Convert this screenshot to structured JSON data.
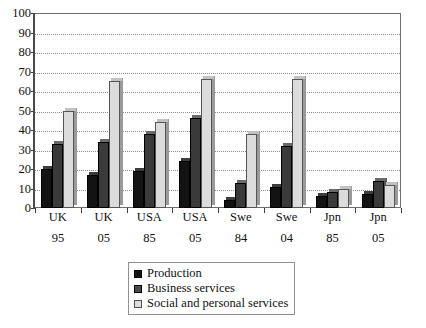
{
  "chart_data": {
    "type": "bar",
    "title": "",
    "xlabel": "",
    "ylabel": "",
    "ylim": [
      0,
      100
    ],
    "y_ticks": [
      0,
      10,
      20,
      30,
      40,
      50,
      60,
      70,
      80,
      90,
      100
    ],
    "grid": true,
    "legend_position": "bottom-center",
    "categories": [
      "UK 95",
      "UK 05",
      "USA 85",
      "USA 05",
      "Swe 84",
      "Swe 04",
      "Jpn 85",
      "Jpn 05"
    ],
    "category_lines": [
      {
        "line1": "UK",
        "line2": "95"
      },
      {
        "line1": "UK",
        "line2": "05"
      },
      {
        "line1": "USA",
        "line2": "85"
      },
      {
        "line1": "USA",
        "line2": "05"
      },
      {
        "line1": "Swe",
        "line2": "84"
      },
      {
        "line1": "Swe",
        "line2": "04"
      },
      {
        "line1": "Jpn",
        "line2": "85"
      },
      {
        "line1": "Jpn",
        "line2": "05"
      }
    ],
    "series": [
      {
        "name": "Production",
        "color": "#131313",
        "values": [
          20,
          17,
          19,
          24,
          4,
          11,
          6,
          7
        ]
      },
      {
        "name": "Business services",
        "color": "#3a3a3a",
        "values": [
          33,
          34,
          38,
          46,
          13,
          32,
          8,
          14
        ]
      },
      {
        "name": "Social and personal services",
        "color": "#dcdcdc",
        "values": [
          50,
          65,
          44,
          66,
          38,
          66,
          10,
          12
        ]
      }
    ]
  },
  "legend": {
    "items": [
      {
        "label": "Production"
      },
      {
        "label": "Business services"
      },
      {
        "label": "Social and personal services"
      }
    ]
  },
  "axis": {
    "y_tick_labels": [
      "100",
      "90",
      "80",
      "70",
      "60",
      "50",
      "40",
      "30",
      "20",
      "10",
      "0"
    ]
  }
}
